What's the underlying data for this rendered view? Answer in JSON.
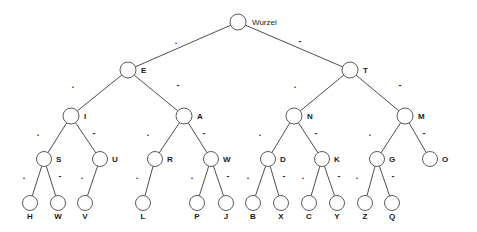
{
  "diagram": {
    "root": {
      "name": "root-node",
      "label": "Wurzel",
      "x": 238,
      "y": 22,
      "r": 8,
      "label_dx": 14,
      "label_dy": 1
    },
    "symbols": {
      "dot": ".",
      "dash": "-"
    },
    "colors": {
      "stroke": "#4a4a4a",
      "line": "#3a3a3a",
      "text": "#1a1a1a",
      "background": "#ffffff"
    },
    "nodes": [
      {
        "id": "E",
        "label": "E",
        "x": 128,
        "y": 70,
        "r": 8,
        "label_dx": 13,
        "label_dy": 1
      },
      {
        "id": "T",
        "label": "T",
        "x": 350,
        "y": 70,
        "r": 8,
        "label_dx": 13,
        "label_dy": 1
      },
      {
        "id": "I",
        "label": "I",
        "x": 71,
        "y": 116,
        "r": 8,
        "label_dx": 13,
        "label_dy": 1
      },
      {
        "id": "A",
        "label": "A",
        "x": 184,
        "y": 116,
        "r": 8,
        "label_dx": 13,
        "label_dy": 1
      },
      {
        "id": "N",
        "label": "N",
        "x": 294,
        "y": 116,
        "r": 8,
        "label_dx": 13,
        "label_dy": 1
      },
      {
        "id": "M",
        "label": "M",
        "x": 405,
        "y": 116,
        "r": 8,
        "label_dx": 13,
        "label_dy": 1
      },
      {
        "id": "S",
        "label": "S",
        "x": 44,
        "y": 159,
        "r": 7.5,
        "label_dx": 12,
        "label_dy": 1
      },
      {
        "id": "U",
        "label": "U",
        "x": 100,
        "y": 159,
        "r": 7.5,
        "label_dx": 12,
        "label_dy": 1
      },
      {
        "id": "R",
        "label": "R",
        "x": 155,
        "y": 159,
        "r": 7.5,
        "label_dx": 12,
        "label_dy": 1
      },
      {
        "id": "W",
        "label": "W",
        "x": 211,
        "y": 159,
        "r": 7.5,
        "label_dx": 12,
        "label_dy": 1
      },
      {
        "id": "D",
        "label": "D",
        "x": 268,
        "y": 159,
        "r": 7.5,
        "label_dx": 12,
        "label_dy": 1
      },
      {
        "id": "K",
        "label": "K",
        "x": 322,
        "y": 159,
        "r": 7.5,
        "label_dx": 12,
        "label_dy": 1
      },
      {
        "id": "G",
        "label": "G",
        "x": 377,
        "y": 159,
        "r": 7.5,
        "label_dx": 12,
        "label_dy": 1
      },
      {
        "id": "O",
        "label": "O",
        "x": 430,
        "y": 159,
        "r": 7.5,
        "label_dx": 12,
        "label_dy": 1
      },
      {
        "id": "H",
        "label": "H",
        "x": 30,
        "y": 203,
        "r": 7.5,
        "label_dx": 0,
        "label_dy": 14
      },
      {
        "id": "V_W",
        "label": "W",
        "x": 58,
        "y": 203,
        "r": 7.5,
        "label_dx": 0,
        "label_dy": 14
      },
      {
        "id": "V",
        "label": "V",
        "x": 85,
        "y": 203,
        "r": 7.5,
        "label_dx": 0,
        "label_dy": 14
      },
      {
        "id": "L",
        "label": "L",
        "x": 143,
        "y": 203,
        "r": 7.5,
        "label_dx": 0,
        "label_dy": 14
      },
      {
        "id": "P",
        "label": "P",
        "x": 197,
        "y": 203,
        "r": 7.5,
        "label_dx": 0,
        "label_dy": 14
      },
      {
        "id": "J",
        "label": "J",
        "x": 226,
        "y": 203,
        "r": 7.5,
        "label_dx": 0,
        "label_dy": 14
      },
      {
        "id": "B",
        "label": "B",
        "x": 253,
        "y": 203,
        "r": 7.5,
        "label_dx": 0,
        "label_dy": 14
      },
      {
        "id": "X",
        "label": "X",
        "x": 281,
        "y": 203,
        "r": 7.5,
        "label_dx": 0,
        "label_dy": 14
      },
      {
        "id": "C",
        "label": "C",
        "x": 309,
        "y": 203,
        "r": 7.5,
        "label_dx": 0,
        "label_dy": 14
      },
      {
        "id": "Y",
        "label": "Y",
        "x": 337,
        "y": 203,
        "r": 7.5,
        "label_dx": 0,
        "label_dy": 14
      },
      {
        "id": "Z",
        "label": "Z",
        "x": 365,
        "y": 203,
        "r": 7.5,
        "label_dx": 0,
        "label_dy": 14
      },
      {
        "id": "Q",
        "label": "Q",
        "x": 392,
        "y": 203,
        "r": 7.5,
        "label_dx": 0,
        "label_dy": 14
      }
    ],
    "edges": [
      {
        "from": "root",
        "to": "E",
        "symbol": ".",
        "sx": 176,
        "sy": 42
      },
      {
        "from": "root",
        "to": "T",
        "symbol": "-",
        "sx": 300,
        "sy": 42
      },
      {
        "from": "E",
        "to": "I",
        "symbol": ".",
        "sx": 73,
        "sy": 86
      },
      {
        "from": "E",
        "to": "A",
        "symbol": "-",
        "sx": 178,
        "sy": 86
      },
      {
        "from": "T",
        "to": "N",
        "symbol": ".",
        "sx": 295,
        "sy": 86
      },
      {
        "from": "T",
        "to": "M",
        "symbol": "-",
        "sx": 400,
        "sy": 86
      },
      {
        "from": "I",
        "to": "S",
        "symbol": ".",
        "sx": 38,
        "sy": 134
      },
      {
        "from": "I",
        "to": "U",
        "symbol": "-",
        "sx": 94,
        "sy": 134
      },
      {
        "from": "A",
        "to": "R",
        "symbol": ".",
        "sx": 148,
        "sy": 134
      },
      {
        "from": "A",
        "to": "W",
        "symbol": "-",
        "sx": 204,
        "sy": 134
      },
      {
        "from": "N",
        "to": "D",
        "symbol": ".",
        "sx": 260,
        "sy": 134
      },
      {
        "from": "N",
        "to": "K",
        "symbol": "-",
        "sx": 316,
        "sy": 134
      },
      {
        "from": "M",
        "to": "G",
        "symbol": ".",
        "sx": 370,
        "sy": 134
      },
      {
        "from": "M",
        "to": "O",
        "symbol": "-",
        "sx": 424,
        "sy": 134
      },
      {
        "from": "S",
        "to": "H",
        "symbol": ".",
        "sx": 24,
        "sy": 177
      },
      {
        "from": "S",
        "to": "V_W",
        "symbol": "-",
        "sx": 60,
        "sy": 177
      },
      {
        "from": "U",
        "to": "V",
        "symbol": ".",
        "sx": 82,
        "sy": 177
      },
      {
        "from": "R",
        "to": "L",
        "symbol": ".",
        "sx": 137,
        "sy": 177
      },
      {
        "from": "W",
        "to": "P",
        "symbol": ".",
        "sx": 192,
        "sy": 177
      },
      {
        "from": "W",
        "to": "J",
        "symbol": "-",
        "sx": 228,
        "sy": 177
      },
      {
        "from": "D",
        "to": "B",
        "symbol": ".",
        "sx": 248,
        "sy": 177
      },
      {
        "from": "D",
        "to": "X",
        "symbol": "-",
        "sx": 284,
        "sy": 177
      },
      {
        "from": "K",
        "to": "C",
        "symbol": ".",
        "sx": 303,
        "sy": 177
      },
      {
        "from": "K",
        "to": "Y",
        "symbol": "-",
        "sx": 339,
        "sy": 177
      },
      {
        "from": "G",
        "to": "Z",
        "symbol": ".",
        "sx": 357,
        "sy": 177
      },
      {
        "from": "G",
        "to": "Q",
        "symbol": "-",
        "sx": 393,
        "sy": 177
      }
    ]
  }
}
